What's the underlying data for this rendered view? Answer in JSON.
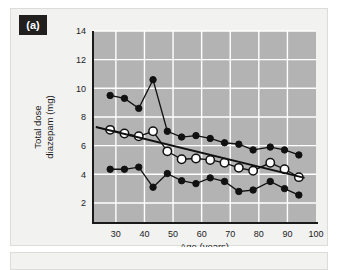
{
  "figure": {
    "panel_label": "(a)"
  },
  "chart_data": {
    "type": "scatter",
    "title": "",
    "xlabel": "Age (years)",
    "ylabel": "Total dose diazepam (mg)",
    "ylabel_line1": "Total dose",
    "ylabel_line2": "diazepam (mg)",
    "xlim": [
      22,
      100
    ],
    "ylim": [
      0.6,
      14
    ],
    "xticks": [
      30,
      40,
      50,
      60,
      70,
      80,
      90,
      100
    ],
    "yticks": [
      2,
      4,
      6,
      8,
      10,
      12,
      14
    ],
    "grid": true,
    "grid_color": "#ffffff",
    "plot_background": "#b3b3b3",
    "legend_position": "none",
    "series": [
      {
        "name": "Upper percentile",
        "marker": "filled-circle",
        "color": "#111111",
        "x": [
          28,
          33,
          38,
          43,
          48,
          53,
          58,
          63,
          68,
          73,
          78,
          84,
          89,
          94
        ],
        "values": [
          9.5,
          9.3,
          8.6,
          10.6,
          7.0,
          6.6,
          6.7,
          6.5,
          6.2,
          6.1,
          5.7,
          5.9,
          5.7,
          5.35
        ]
      },
      {
        "name": "Median",
        "marker": "open-circle",
        "color": "#ffffff",
        "x": [
          28,
          33,
          38,
          43,
          48,
          53,
          58,
          63,
          68,
          73,
          78,
          84,
          89,
          94
        ],
        "values": [
          7.1,
          6.85,
          6.65,
          7.0,
          5.6,
          5.05,
          5.1,
          5.0,
          4.8,
          4.45,
          4.25,
          4.8,
          4.35,
          3.8
        ]
      },
      {
        "name": "Lower percentile",
        "marker": "filled-circle",
        "color": "#111111",
        "x": [
          28,
          33,
          38,
          43,
          48,
          53,
          58,
          63,
          68,
          73,
          78,
          84,
          89,
          94
        ],
        "values": [
          4.35,
          4.35,
          4.5,
          3.1,
          4.05,
          3.55,
          3.35,
          3.75,
          3.5,
          2.8,
          2.9,
          3.5,
          3.0,
          2.55
        ]
      }
    ],
    "trend_line": {
      "name": "Regression line",
      "color": "#111111",
      "x": [
        23,
        96
      ],
      "values": [
        7.3,
        3.75
      ]
    }
  }
}
